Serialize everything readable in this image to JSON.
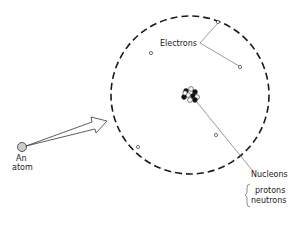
{
  "diagram": {
    "type": "atom-structure",
    "labels": {
      "electrons": "Electrons",
      "nucleons": "Nucleons",
      "protons": "protons",
      "neutrons": "neutrons",
      "atom_line1": "An",
      "atom_line2": "atom"
    },
    "colors": {
      "line": "#1a1a1a",
      "leader": "#555555",
      "atom_fill": "#cccccc"
    },
    "components": [
      {
        "name": "atom",
        "description": "small shaded circle representing an atom"
      },
      {
        "name": "magnify-arrow",
        "description": "hollow arrow from atom to enlarged view"
      },
      {
        "name": "electron-shell",
        "description": "dashed circle boundary of the enlarged atom"
      },
      {
        "name": "electrons",
        "count": 5
      },
      {
        "name": "nucleus",
        "description": "cluster of black (protons) and white (neutrons) nucleons"
      }
    ]
  }
}
